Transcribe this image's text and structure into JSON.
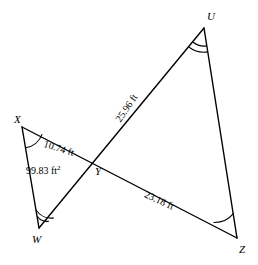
{
  "figure": {
    "type": "geometry-diagram",
    "background_color": "#ffffff",
    "stroke_color": "#000000"
  },
  "vertices": [
    {
      "id": "X",
      "label": "X",
      "x": 22,
      "y": 127,
      "label_x": 14,
      "label_y": 114
    },
    {
      "id": "W",
      "label": "W",
      "x": 39,
      "y": 228,
      "label_x": 32,
      "label_y": 234
    },
    {
      "id": "Y",
      "label": "Y",
      "x": 92,
      "y": 162,
      "label_x": 95,
      "label_y": 166
    },
    {
      "id": "U",
      "label": "U",
      "x": 204,
      "y": 28,
      "label_x": 207,
      "label_y": 11
    },
    {
      "id": "Z",
      "label": "Z",
      "x": 237,
      "y": 238,
      "label_x": 239,
      "label_y": 244
    }
  ],
  "segments": [
    {
      "name": "XZ",
      "from": "X",
      "to": "Z"
    },
    {
      "name": "WU",
      "from": "W",
      "to": "U"
    },
    {
      "name": "XW",
      "from": "X",
      "to": "W"
    },
    {
      "name": "UZ",
      "from": "U",
      "to": "Z"
    }
  ],
  "measure_labels": [
    {
      "name": "xy-length",
      "text": "10.74 ft",
      "x": 44,
      "y": 139,
      "rotation": 17
    },
    {
      "name": "area",
      "text": "99.83 ft",
      "sup": "2",
      "x": 26,
      "y": 166,
      "rotation": 0
    },
    {
      "name": "uy-length",
      "text": "25.96 ft",
      "x": 118,
      "y": 116,
      "rotation": -56
    },
    {
      "name": "yz-length",
      "text": "23.18 ft",
      "x": 145,
      "y": 189,
      "rotation": 25
    }
  ],
  "angle_marks": [
    {
      "name": "angle-x",
      "vertex": "X",
      "arcs": 1
    },
    {
      "name": "angle-z",
      "vertex": "Z",
      "arcs": 1
    },
    {
      "name": "angle-w",
      "vertex": "W",
      "arcs": 2
    },
    {
      "name": "angle-u",
      "vertex": "U",
      "arcs": 2
    }
  ]
}
